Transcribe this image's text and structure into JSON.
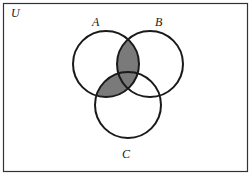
{
  "diagram": {
    "type": "venn",
    "universe_label": "U",
    "sets": [
      {
        "label": "A",
        "cx": 106,
        "cy": 64,
        "r": 33
      },
      {
        "label": "B",
        "cx": 150,
        "cy": 64,
        "r": 33
      },
      {
        "label": "C",
        "cx": 128,
        "cy": 105,
        "r": 33
      }
    ],
    "shaded_regions": [
      "A∩B",
      "A∩C"
    ],
    "shaded_expression": "A ∩ (B ∪ C)",
    "colors": {
      "stroke": "#1a1a1a",
      "shade": "#7a7a7a",
      "background": "#ffffff",
      "frame": "#333333"
    }
  }
}
